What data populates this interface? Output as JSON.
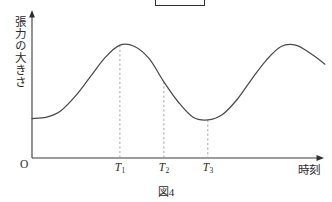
{
  "figure": {
    "caption_label": "図",
    "caption_number": "4",
    "top_box_name": "redacted-box"
  },
  "chart_data": {
    "type": "line",
    "title": "",
    "subtitle": "",
    "xlabel": "時刻",
    "ylabel": "張力の大きさ",
    "origin_label": "O",
    "grid": false,
    "legend": null,
    "axes": {
      "x_axis_arrow": true,
      "y_axis_arrow": true,
      "xlim": [
        0,
        10
      ],
      "ylim": [
        0,
        10
      ]
    },
    "xticks": [
      {
        "label": "T",
        "sub": "1",
        "x": 3.0
      },
      {
        "label": "T",
        "sub": "2",
        "x": 4.5
      },
      {
        "label": "T",
        "sub": "3",
        "x": 6.0
      }
    ],
    "yticks": [],
    "annotations": [
      {
        "name": "dashed-guide-T1",
        "x": 3.0,
        "y_top": 8.3,
        "note": "dashed vertical from first peak to x-axis"
      },
      {
        "name": "dashed-guide-T2",
        "x": 4.5,
        "y_top": 5.6,
        "note": "dashed vertical from midpoint of falling edge to x-axis"
      },
      {
        "name": "dashed-guide-T3",
        "x": 6.0,
        "y_top": 2.8,
        "note": "dashed vertical from trough to x-axis"
      }
    ],
    "series": [
      {
        "name": "張力の大きさ",
        "color": "#4a4a4a",
        "points": [
          {
            "x": 0.0,
            "y": 2.9
          },
          {
            "x": 0.5,
            "y": 3.0
          },
          {
            "x": 1.0,
            "y": 3.5
          },
          {
            "x": 1.5,
            "y": 4.6
          },
          {
            "x": 2.0,
            "y": 6.0
          },
          {
            "x": 2.5,
            "y": 7.4
          },
          {
            "x": 3.0,
            "y": 8.3
          },
          {
            "x": 3.5,
            "y": 8.2
          },
          {
            "x": 4.0,
            "y": 7.3
          },
          {
            "x": 4.5,
            "y": 5.6
          },
          {
            "x": 5.0,
            "y": 4.1
          },
          {
            "x": 5.5,
            "y": 3.0
          },
          {
            "x": 6.0,
            "y": 2.8
          },
          {
            "x": 6.5,
            "y": 3.2
          },
          {
            "x": 7.0,
            "y": 4.3
          },
          {
            "x": 7.5,
            "y": 5.8
          },
          {
            "x": 8.0,
            "y": 7.2
          },
          {
            "x": 8.5,
            "y": 8.2
          },
          {
            "x": 9.0,
            "y": 8.3
          },
          {
            "x": 9.5,
            "y": 7.7
          },
          {
            "x": 10.0,
            "y": 6.9
          }
        ]
      }
    ]
  }
}
